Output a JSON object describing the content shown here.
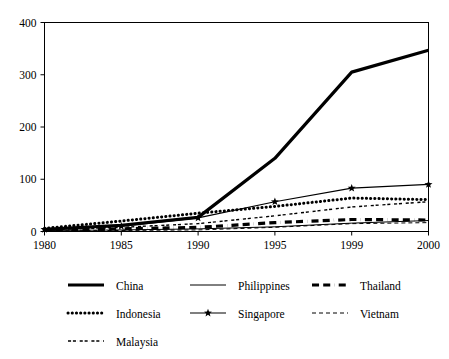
{
  "chart_data": {
    "type": "line",
    "title": "",
    "subtitle": "",
    "xlabel": "",
    "ylabel": "",
    "categories": [
      "1980",
      "1985",
      "1990",
      "1995",
      "1999",
      "2000"
    ],
    "xtick_labels": [
      "1980",
      "1985",
      "1990",
      "1995",
      "1999",
      "2000"
    ],
    "ytick_labels": [
      "0",
      "100",
      "200",
      "300",
      "400"
    ],
    "yticks": [
      0,
      100,
      200,
      300,
      400
    ],
    "ylim": [
      0,
      400
    ],
    "grid": false,
    "legend_position": "bottom",
    "axis_color": "#000000",
    "series": [
      {
        "name": "China",
        "label": "China",
        "style": "solid",
        "width": 3.2,
        "marker": "none",
        "color": "#000000",
        "values": [
          4,
          12,
          27,
          140,
          305,
          347
        ]
      },
      {
        "name": "Indonesia",
        "label": "Indonesia",
        "style": "dotted",
        "width": 3.0,
        "marker": "none",
        "color": "#000000",
        "values": [
          6,
          20,
          35,
          48,
          64,
          61
        ]
      },
      {
        "name": "Malaysia",
        "label": "Malaysia",
        "style": "dashdot",
        "width": 1.4,
        "marker": "none",
        "color": "#000000",
        "values": [
          3,
          8,
          15,
          30,
          47,
          57
        ]
      },
      {
        "name": "Philippines",
        "label": "Philippines",
        "style": "solid",
        "width": 1.0,
        "marker": "none",
        "color": "#000000",
        "values": [
          2,
          3,
          5,
          9,
          16,
          21
        ]
      },
      {
        "name": "Singapore",
        "label": "Singapore",
        "style": "solid",
        "width": 1.2,
        "marker": "star",
        "color": "#000000",
        "values": [
          4,
          10,
          26,
          57,
          83,
          90
        ]
      },
      {
        "name": "Thailand",
        "label": "Thailand",
        "style": "dashdot",
        "width": 3.2,
        "marker": "none",
        "color": "#000000",
        "values": [
          2,
          5,
          8,
          17,
          23,
          22
        ]
      },
      {
        "name": "Vietnam",
        "label": "Vietnam",
        "style": "dashed-fine",
        "width": 1.0,
        "marker": "none",
        "color": "#000000",
        "values": [
          1,
          2,
          3,
          8,
          15,
          17
        ]
      }
    ],
    "legend_rows": [
      [
        "China",
        "Philippines",
        "Thailand"
      ],
      [
        "Indonesia",
        "Singapore",
        "Vietnam"
      ],
      [
        "Malaysia",
        "",
        ""
      ]
    ]
  }
}
